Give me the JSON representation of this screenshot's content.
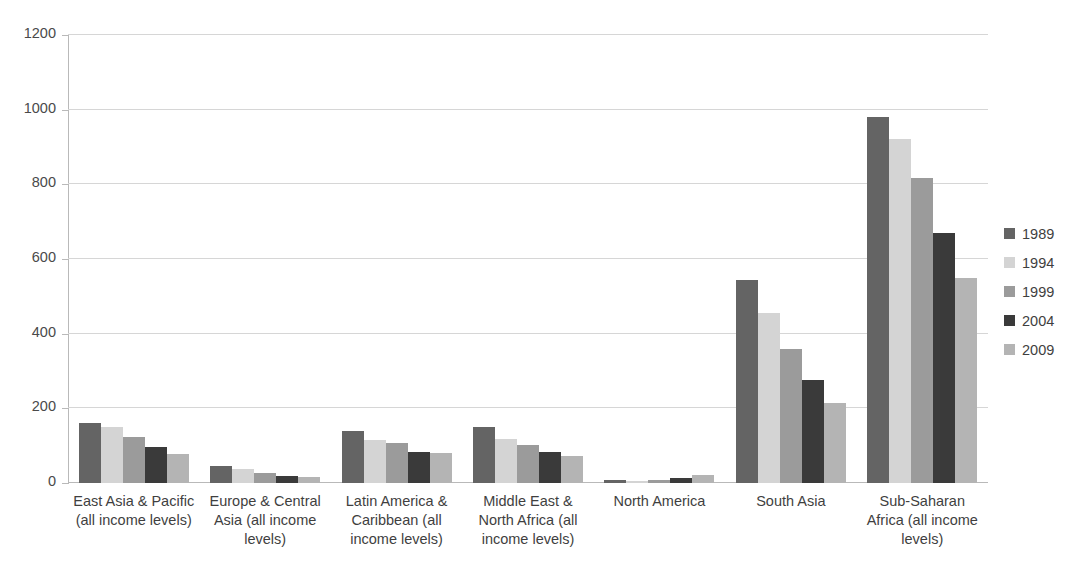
{
  "chart_data": {
    "type": "bar",
    "title": "",
    "subtitle": "",
    "xlabel": "",
    "ylabel": "",
    "ylim": [
      0,
      1200
    ],
    "ytick_labels": [
      "0",
      "200",
      "400",
      "600",
      "800",
      "1000",
      "1200"
    ],
    "ytick_values": [
      0,
      200,
      400,
      600,
      800,
      1000,
      1200
    ],
    "grid": true,
    "legend_position": "right",
    "categories": [
      "East Asia & Pacific (all income levels)",
      "Europe & Central Asia (all income levels)",
      "Latin America & Caribbean (all income levels)",
      "Middle East & North Africa (all income levels)",
      "North America",
      "South Asia",
      "Sub-Saharan Africa (all income levels)"
    ],
    "category_lines": [
      [
        "East Asia & Pacific",
        "(all income levels)"
      ],
      [
        "Europe & Central",
        "Asia (all income",
        "levels)"
      ],
      [
        "Latin America &",
        "Caribbean (all",
        "income levels)"
      ],
      [
        "Middle East &",
        "North Africa (all",
        "income levels)"
      ],
      [
        "North America"
      ],
      [
        "South Asia"
      ],
      [
        "Sub-Saharan",
        "Africa (all income",
        "levels)"
      ]
    ],
    "series": [
      {
        "name": "1989",
        "color": "#646464",
        "values": [
          161,
          45,
          139,
          150,
          8,
          544,
          980
        ]
      },
      {
        "name": "1994",
        "color": "#d4d4d4",
        "values": [
          150,
          37,
          115,
          118,
          6,
          455,
          921
        ]
      },
      {
        "name": "1999",
        "color": "#9b9b9b",
        "values": [
          123,
          27,
          107,
          102,
          9,
          359,
          817
        ]
      },
      {
        "name": "2004",
        "color": "#3a3a3a",
        "values": [
          96,
          19,
          83,
          83,
          13,
          276,
          670
        ]
      },
      {
        "name": "2009",
        "color": "#b4b4b4",
        "values": [
          78,
          16,
          80,
          72,
          22,
          214,
          549
        ]
      }
    ]
  },
  "colors": {
    "gridline": "#d6d6d6",
    "axis": "#b9b9b9",
    "text": "#3f3f3f",
    "background": "#ffffff"
  }
}
